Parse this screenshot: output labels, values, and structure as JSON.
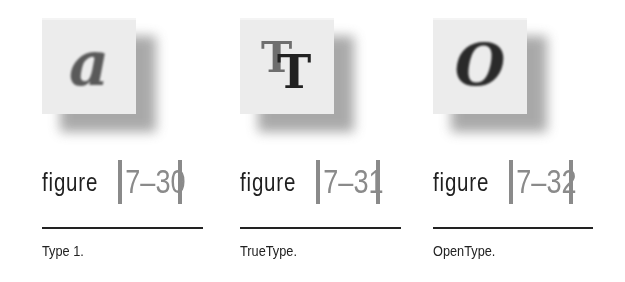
{
  "figures": [
    {
      "glyph": "a",
      "word": "figure",
      "number": "7–30",
      "label": "Type 1."
    },
    {
      "glyph_back": "T",
      "glyph_front": "T",
      "word": "figure",
      "number": "7–31",
      "label": "TrueType."
    },
    {
      "glyph": "O",
      "word": "figure",
      "number": "7–32",
      "label": "OpenType."
    }
  ],
  "colors": {
    "bar": "#8a8a8a",
    "number": "#8a8a8a",
    "rule": "#222222",
    "tile": "#ececec"
  }
}
